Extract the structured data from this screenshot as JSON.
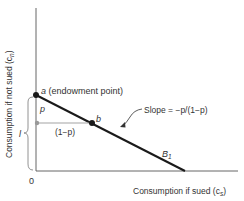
{
  "axes": {
    "y_label": "Consumption if not sued (c",
    "y_label_sub": "n",
    "y_label_close": ")",
    "x_label": "Consumption if sued (c",
    "x_label_sub": "s",
    "x_label_close": ")",
    "origin": "0"
  },
  "points": {
    "a": {
      "name": "a",
      "desc": " (endowment point)"
    },
    "b": {
      "name": "b"
    }
  },
  "labels": {
    "p": "p",
    "one_minus_p": "(1−p)",
    "l": "l",
    "slope": "Slope = −p/(1−p)",
    "budget": "B",
    "budget_sub": "1"
  },
  "colors": {
    "line": "#1a1a1a",
    "axis": "#555555",
    "gray": "#999999"
  }
}
